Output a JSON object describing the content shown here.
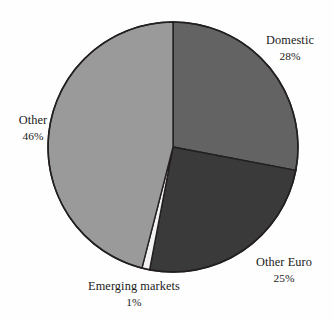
{
  "chart_data": {
    "type": "pie",
    "title": "",
    "categories": [
      "Domestic",
      "Other Euro",
      "Emerging markets",
      "Other"
    ],
    "values": [
      28,
      25,
      1,
      46
    ],
    "value_labels": [
      "28%",
      "25%",
      "1%",
      "46%"
    ],
    "unit": "%",
    "start_angle_deg": 0,
    "direction": "clockwise",
    "legend": "none",
    "grid": false,
    "slice_colors": [
      "#636363",
      "#3a3a3a",
      "#f2f2f2",
      "#9a9a9a"
    ],
    "slices": [
      {
        "label": "Domestic",
        "value": 28,
        "value_label": "28%",
        "color": "#636363"
      },
      {
        "label": "Other Euro",
        "value": 25,
        "value_label": "25%",
        "color": "#3a3a3a"
      },
      {
        "label": "Emerging markets",
        "value": 1,
        "value_label": "1%",
        "color": "#f2f2f2"
      },
      {
        "label": "Other",
        "value": 46,
        "value_label": "46%",
        "color": "#9a9a9a"
      }
    ]
  },
  "labels": {
    "domestic": {
      "name": "Domestic",
      "value": "28%"
    },
    "other_euro": {
      "name": "Other Euro",
      "value": "25%"
    },
    "emerging": {
      "name": "Emerging markets",
      "value": "1%"
    },
    "other": {
      "name": "Other",
      "value": "46%"
    }
  },
  "style": {
    "background": "#fefefe",
    "outline": "#231f20",
    "text": "#1a1a1a"
  }
}
